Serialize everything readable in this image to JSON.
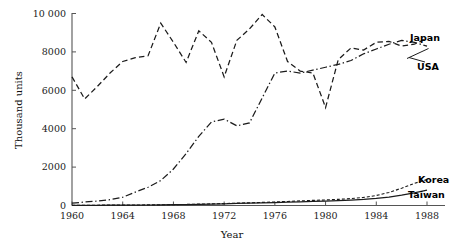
{
  "chart_data": {
    "type": "line",
    "title": "",
    "xlabel": "Year",
    "ylabel": "Thousand units",
    "xlim": [
      1960,
      1989
    ],
    "ylim": [
      0,
      10000
    ],
    "grid": false,
    "legend_position": "right-inline-labels",
    "x_ticks": [
      "1960",
      "1964",
      "1968",
      "1972",
      "1976",
      "1980",
      "1984",
      "1988"
    ],
    "x_tick_values": [
      1960,
      1964,
      1968,
      1972,
      1976,
      1980,
      1984,
      1988
    ],
    "y_ticks": [
      "0",
      "2000",
      "4000",
      "6000",
      "8000",
      "10 000"
    ],
    "y_tick_values": [
      0,
      2000,
      4000,
      6000,
      8000,
      10000
    ],
    "x": [
      1960,
      1961,
      1962,
      1963,
      1964,
      1965,
      1966,
      1967,
      1968,
      1969,
      1970,
      1971,
      1972,
      1973,
      1974,
      1975,
      1976,
      1977,
      1978,
      1979,
      1980,
      1981,
      1982,
      1983,
      1984,
      1985,
      1986,
      1987,
      1988
    ],
    "series": [
      {
        "name": "Japan",
        "style": "dashed",
        "values": [
          6700,
          5550,
          6200,
          6900,
          7500,
          7700,
          7800,
          9500,
          8500,
          7450,
          9100,
          8500,
          6700,
          8600,
          9200,
          9950,
          9300,
          7500,
          7000,
          6900,
          5100,
          7600,
          8200,
          8100,
          8500,
          8550,
          8300,
          8400,
          8700
        ]
      },
      {
        "name": "USA",
        "style": "dash-dot",
        "values": [
          120,
          180,
          230,
          300,
          430,
          700,
          950,
          1300,
          1900,
          2700,
          3600,
          4350,
          4500,
          4150,
          4300,
          5600,
          6900,
          7000,
          6900,
          7050,
          7200,
          7350,
          7550,
          7900,
          8150,
          8400,
          8600,
          8500,
          8300
        ]
      },
      {
        "name": "Korea",
        "style": "fine-dashed",
        "values": [
          10,
          12,
          15,
          18,
          22,
          26,
          30,
          36,
          45,
          55,
          70,
          85,
          100,
          120,
          140,
          160,
          185,
          210,
          240,
          265,
          290,
          320,
          360,
          420,
          520,
          680,
          900,
          1150,
          1350
        ]
      },
      {
        "name": "Taiwan",
        "style": "solid",
        "values": [
          8,
          10,
          12,
          14,
          18,
          22,
          26,
          32,
          40,
          50,
          62,
          75,
          90,
          105,
          120,
          135,
          150,
          170,
          190,
          210,
          230,
          255,
          285,
          320,
          370,
          440,
          540,
          660,
          800
        ]
      }
    ]
  },
  "labels": {
    "japan": "Japan",
    "usa": "USA",
    "korea": "Korea",
    "taiwan": "Taiwan",
    "x_axis_title": "Year",
    "y_axis_title": "Thousand units"
  },
  "colors": {
    "ink": "#1b1b1b",
    "axis": "#555555",
    "background": "#ffffff"
  }
}
